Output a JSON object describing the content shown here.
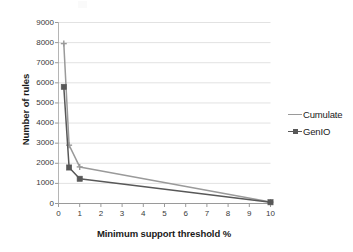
{
  "chart_data": {
    "type": "line",
    "title": "",
    "xlabel": "Minimum support threshold  %",
    "ylabel": "Number of rules",
    "xlim": [
      0,
      10
    ],
    "ylim": [
      0,
      9000
    ],
    "xticks": [
      "0",
      "1",
      "2",
      "3",
      "4",
      "5",
      "6",
      "7",
      "8",
      "9",
      "10"
    ],
    "yticks": [
      "0",
      "1000",
      "2000",
      "3000",
      "4000",
      "5000",
      "6000",
      "7000",
      "8000",
      "9000"
    ],
    "grid": "horizontal",
    "legend_position": "right",
    "series": [
      {
        "name": "Cumulate",
        "color": "#9a9a9a",
        "marker": "cross",
        "x": [
          0.25,
          0.5,
          1.0,
          10
        ],
        "values": [
          7950,
          2900,
          1820,
          70
        ]
      },
      {
        "name": "GenIO",
        "color": "#585858",
        "marker": "square",
        "x": [
          0.25,
          0.5,
          1.0,
          10
        ],
        "values": [
          5800,
          1790,
          1230,
          60
        ]
      }
    ]
  },
  "axes": {
    "y_title": "Number of rules",
    "x_title": "Minimum support threshold  %"
  },
  "legend": {
    "items": [
      {
        "label": "Cumulate",
        "color": "#9a9a9a"
      },
      {
        "label": "GenIO",
        "color": "#585858"
      }
    ]
  }
}
